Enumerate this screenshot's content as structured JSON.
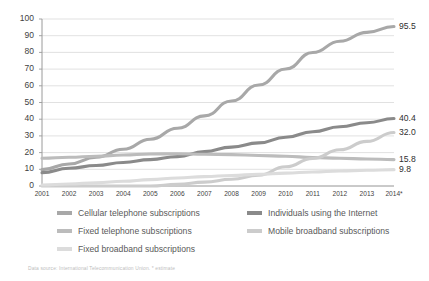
{
  "chart_data": {
    "type": "line",
    "title": "",
    "xlabel": "",
    "ylabel": "",
    "ylim": [
      0,
      100
    ],
    "yticks": [
      0,
      10,
      20,
      30,
      40,
      50,
      60,
      70,
      80,
      90,
      100
    ],
    "grid": true,
    "legend_position": "bottom",
    "categories": [
      "2001",
      "2002",
      "2003",
      "2004",
      "2005",
      "2006",
      "2007",
      "2008",
      "2009",
      "2010",
      "2011",
      "2012",
      "2013",
      "2014*"
    ],
    "series": [
      {
        "name": "Cellular telephone subscriptions",
        "color": "#a8a8a8",
        "end_label": "95.5",
        "values": [
          9.8,
          13.2,
          17.2,
          22.0,
          28.0,
          34.6,
          42.0,
          50.9,
          60.5,
          70.1,
          79.9,
          86.7,
          92.0,
          95.5
        ]
      },
      {
        "name": "Individuals using the Internet",
        "color": "#8a8a8a",
        "end_label": "40.4",
        "values": [
          8.0,
          10.6,
          12.3,
          14.1,
          15.8,
          17.6,
          20.6,
          23.3,
          25.8,
          29.2,
          32.5,
          35.5,
          37.9,
          40.4
        ]
      },
      {
        "name": "Fixed telephone subscriptions",
        "color": "#bcbcbc",
        "end_label": "15.8",
        "values": [
          16.6,
          17.2,
          17.8,
          18.6,
          19.2,
          19.3,
          19.0,
          18.8,
          18.3,
          17.8,
          17.1,
          16.6,
          16.2,
          15.8
        ]
      },
      {
        "name": "Mobile broadband subscriptions",
        "color": "#cccccc",
        "end_label": "32.0",
        "values": [
          0.0,
          0.0,
          0.0,
          0.0,
          0.0,
          1.0,
          2.3,
          4.0,
          6.5,
          11.5,
          16.5,
          21.7,
          26.7,
          32.0
        ]
      },
      {
        "name": "Fixed broadband subscriptions",
        "color": "#dcdcdc",
        "end_label": "9.8",
        "values": [
          0.6,
          1.2,
          1.9,
          2.8,
          3.8,
          4.8,
          5.6,
          6.3,
          7.0,
          7.7,
          8.4,
          9.0,
          9.4,
          9.8
        ]
      }
    ]
  },
  "legend": {
    "items": [
      {
        "label": "Cellular telephone subscriptions",
        "color": "#a8a8a8",
        "col": 0,
        "row": 0
      },
      {
        "label": "Fixed telephone subscriptions",
        "color": "#bcbcbc",
        "col": 0,
        "row": 1
      },
      {
        "label": "Fixed broadband subscriptions",
        "color": "#dcdcdc",
        "col": 0,
        "row": 2
      },
      {
        "label": "Individuals using the Internet",
        "color": "#8a8a8a",
        "col": 1,
        "row": 0
      },
      {
        "label": "Mobile broadband subscriptions",
        "color": "#cccccc",
        "col": 1,
        "row": 1
      }
    ]
  },
  "footer": {
    "source": "Data source: International Telecommunication Union. * estimate"
  },
  "colors": {
    "gridline": "#d9d9d9",
    "axis": "#9a9a9a",
    "tick_text": "#3f3f3f",
    "legend_text": "#595959",
    "source_text": "#bdbdbd",
    "background": "#ffffff"
  }
}
